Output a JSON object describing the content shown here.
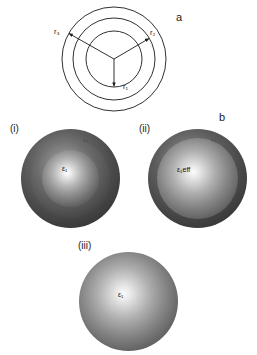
{
  "figure": {
    "panels": [
      {
        "letter": "a"
      },
      {
        "letter": "b"
      }
    ]
  },
  "panel_a": {
    "letter": "a",
    "description": "Three concentric circles with radius arrows from a common centre",
    "circles": [
      {
        "name": "inner",
        "radius_label": "r1"
      },
      {
        "name": "middle",
        "radius_label": "r2"
      },
      {
        "name": "outer",
        "radius_label": "r3"
      }
    ],
    "radius_labels": {
      "r1": "r₁",
      "r2": "r₂",
      "r3": "r₃"
    }
  },
  "panel_b": {
    "letter": "b",
    "spheres": [
      {
        "index": "(i)",
        "name": "core-shell-shell-sphere",
        "core_label": "ε₁",
        "shell_label": "ε₂",
        "layers": 3
      },
      {
        "index": "(ii)",
        "name": "effective-core-sphere",
        "core_label": "ε₁eff",
        "shell_label": "ε₂",
        "layers": 2
      },
      {
        "index": "(iii)",
        "name": "homogeneous-sphere",
        "core_label": "ε₁",
        "layers": 1
      }
    ]
  },
  "colors": {
    "background": "#ffffff",
    "stroke": "#1a1a1a",
    "sphere_dark": "#2e2e2e",
    "sphere_mid": "#6b6b6b",
    "sphere_highlight": "#ffffff",
    "text": "#111111"
  }
}
